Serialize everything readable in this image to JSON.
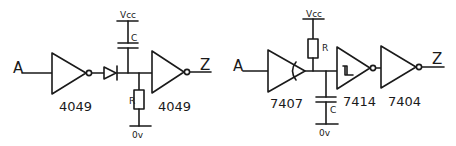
{
  "diagram": {
    "type": "logic-circuit-schematics",
    "circuits": [
      {
        "id": "left",
        "input_label": "A",
        "output_label": "Z",
        "supply_label": "Vcc",
        "ground_label": "0v",
        "components": {
          "gate1_label": "4049",
          "gate2_label": "4049",
          "capacitor_label": "C",
          "resistor_label": "R"
        }
      },
      {
        "id": "right",
        "input_label": "A",
        "output_label": "Z",
        "supply_label": "Vcc",
        "ground_label": "0v",
        "components": {
          "buffer_label": "7407",
          "schmitt_label": "7414",
          "inverter_label": "7404",
          "capacitor_label": "C",
          "resistor_label": "R"
        }
      }
    ]
  }
}
